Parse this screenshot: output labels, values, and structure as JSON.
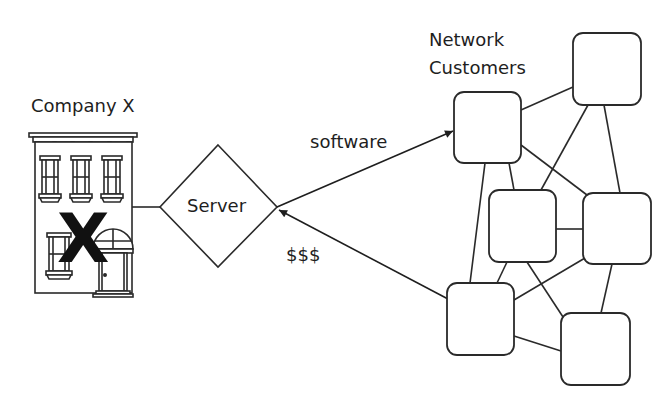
{
  "diagram": {
    "company": {
      "label": "Company X",
      "mark": "X"
    },
    "server": {
      "label": "Server"
    },
    "network": {
      "title_line1": "Network",
      "title_line2": "Customers",
      "node_count": 6
    },
    "flows": {
      "outgoing": "software",
      "incoming": "$$$"
    },
    "colors": {
      "stroke": "#2a2a2a",
      "text": "#1e1e1e",
      "background": "#ffffff"
    }
  }
}
